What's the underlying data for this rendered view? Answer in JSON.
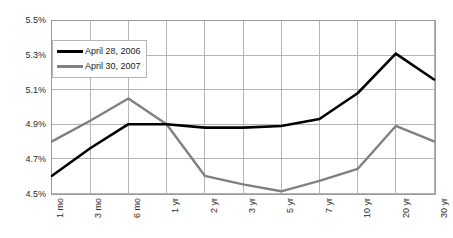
{
  "chart_data": {
    "type": "line",
    "title": "",
    "subtitle": "",
    "xlabel": "",
    "ylabel": "",
    "categories": [
      "1 mo",
      "3 mo",
      "6 mo",
      "1 yr",
      "2 yr",
      "3 yr",
      "5 yr",
      "7 yr",
      "10 yr",
      "20 yr",
      "30 yr"
    ],
    "series": [
      {
        "name": "April 28, 2006",
        "color": "#000000",
        "values": [
          4.6,
          4.76,
          4.9,
          4.9,
          4.88,
          4.88,
          4.89,
          4.93,
          5.08,
          5.31,
          5.16
        ]
      },
      {
        "name": "April 30, 2007",
        "color": "#808080",
        "values": [
          4.8,
          4.92,
          5.05,
          4.9,
          4.6,
          4.55,
          4.51,
          4.57,
          4.64,
          4.89,
          4.8
        ]
      }
    ],
    "yticks": [
      "4.5%",
      "4.7%",
      "4.9%",
      "5.1%",
      "5.3%",
      "5.5%"
    ],
    "ytick_values": [
      4.5,
      4.7,
      4.9,
      5.1,
      5.3,
      5.5
    ],
    "ylim": [
      4.5,
      5.5
    ],
    "grid": true,
    "grid_color": "#b4b4b4",
    "axis_color": "#9a9a9a",
    "legend_position": "upper-left",
    "background": "#ffffff"
  },
  "legend": {
    "items": [
      {
        "label": "April 28, 2006",
        "color": "#000000"
      },
      {
        "label": "April 30, 2007",
        "color": "#808080"
      }
    ]
  }
}
